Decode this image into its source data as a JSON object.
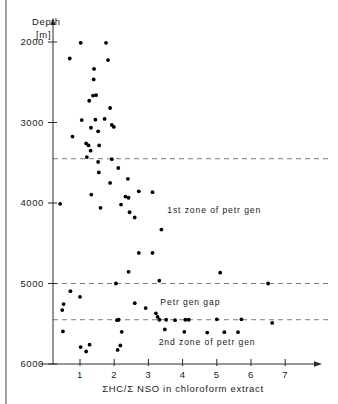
{
  "axes": {
    "y_title_line1": "Depth",
    "y_title_line2": "[m]",
    "x_title": "ΣHC/Σ NSO in chloroform extract",
    "y_ticks": [
      {
        "label": "2000",
        "value": 2000
      },
      {
        "label": "3000",
        "value": 3000
      },
      {
        "label": "4000",
        "value": 4000
      },
      {
        "label": "5000",
        "value": 5000
      },
      {
        "label": "6000",
        "value": 6000
      }
    ],
    "x_ticks": [
      {
        "label": "1",
        "value": 1
      },
      {
        "label": "2",
        "value": 2
      },
      {
        "label": "3",
        "value": 3
      },
      {
        "label": "4",
        "value": 4
      },
      {
        "label": "5",
        "value": 5
      },
      {
        "label": "6",
        "value": 6
      },
      {
        "label": "7",
        "value": 7
      }
    ]
  },
  "annotations": [
    {
      "name": "first-zone-label",
      "text": "1st zone of petr gen",
      "x": 3.55,
      "y": 4130
    },
    {
      "name": "petr-gen-gap-label",
      "text": "Petr gen gap",
      "x": 3.35,
      "y": 5270
    },
    {
      "name": "second-zone-label",
      "text": "2nd zone of petr gen",
      "x": 3.3,
      "y": 5760
    }
  ],
  "reference_lines": [
    {
      "name": "top-of-first-zone",
      "depth": 3450
    },
    {
      "name": "base-of-first-zone",
      "depth": 5000
    },
    {
      "name": "top-of-second-zone",
      "depth": 5450
    }
  ],
  "colors": {
    "point": "#000000",
    "axis": "#2a2a2a",
    "dashed": "#7d7d7d",
    "background": "#ffffff"
  },
  "chart_data": {
    "type": "scatter",
    "title": "",
    "xlabel": "ΣHC/Σ NSO in chloroform extract",
    "ylabel": "Depth [m]",
    "xlim": [
      0.3,
      7.8
    ],
    "ylim": [
      6100,
      1780
    ],
    "y_inverted": true,
    "grid": false,
    "legend": false,
    "marker": "filled-circle",
    "points": [
      {
        "x": 1.02,
        "y": 2010
      },
      {
        "x": 1.76,
        "y": 2010
      },
      {
        "x": 0.7,
        "y": 2205
      },
      {
        "x": 1.82,
        "y": 2225
      },
      {
        "x": 1.41,
        "y": 2335
      },
      {
        "x": 1.4,
        "y": 2465
      },
      {
        "x": 1.38,
        "y": 2665
      },
      {
        "x": 1.47,
        "y": 2660
      },
      {
        "x": 1.27,
        "y": 2730
      },
      {
        "x": 1.88,
        "y": 2820
      },
      {
        "x": 1.05,
        "y": 2970
      },
      {
        "x": 1.45,
        "y": 2965
      },
      {
        "x": 1.72,
        "y": 2955
      },
      {
        "x": 1.32,
        "y": 3065
      },
      {
        "x": 1.93,
        "y": 3030
      },
      {
        "x": 1.99,
        "y": 3055
      },
      {
        "x": 0.78,
        "y": 3175
      },
      {
        "x": 1.53,
        "y": 3110
      },
      {
        "x": 1.18,
        "y": 3260
      },
      {
        "x": 1.25,
        "y": 3285
      },
      {
        "x": 1.56,
        "y": 3285
      },
      {
        "x": 1.31,
        "y": 3350
      },
      {
        "x": 1.2,
        "y": 3430
      },
      {
        "x": 1.53,
        "y": 3490
      },
      {
        "x": 1.93,
        "y": 3455
      },
      {
        "x": 1.55,
        "y": 3620
      },
      {
        "x": 2.12,
        "y": 3565
      },
      {
        "x": 1.88,
        "y": 3750
      },
      {
        "x": 2.4,
        "y": 3700
      },
      {
        "x": 0.42,
        "y": 4010
      },
      {
        "x": 1.33,
        "y": 3895
      },
      {
        "x": 2.72,
        "y": 3855
      },
      {
        "x": 2.33,
        "y": 3920
      },
      {
        "x": 2.42,
        "y": 3935
      },
      {
        "x": 3.12,
        "y": 3865
      },
      {
        "x": 1.6,
        "y": 4060
      },
      {
        "x": 2.2,
        "y": 4020
      },
      {
        "x": 2.45,
        "y": 4115
      },
      {
        "x": 2.6,
        "y": 4180
      },
      {
        "x": 3.38,
        "y": 4330
      },
      {
        "x": 2.72,
        "y": 4620
      },
      {
        "x": 3.12,
        "y": 4620
      },
      {
        "x": 2.42,
        "y": 4855
      },
      {
        "x": 5.1,
        "y": 4865
      },
      {
        "x": 2.05,
        "y": 5000
      },
      {
        "x": 3.32,
        "y": 4965
      },
      {
        "x": 6.5,
        "y": 5000
      },
      {
        "x": 0.72,
        "y": 5095
      },
      {
        "x": 1.0,
        "y": 5165
      },
      {
        "x": 0.52,
        "y": 5255
      },
      {
        "x": 2.6,
        "y": 5245
      },
      {
        "x": 0.48,
        "y": 5330
      },
      {
        "x": 2.92,
        "y": 5305
      },
      {
        "x": 3.22,
        "y": 5370
      },
      {
        "x": 3.27,
        "y": 5415
      },
      {
        "x": 2.08,
        "y": 5455
      },
      {
        "x": 2.13,
        "y": 5450
      },
      {
        "x": 3.32,
        "y": 5450
      },
      {
        "x": 3.52,
        "y": 5450
      },
      {
        "x": 3.78,
        "y": 5455
      },
      {
        "x": 4.08,
        "y": 5450
      },
      {
        "x": 4.18,
        "y": 5450
      },
      {
        "x": 5.0,
        "y": 5445
      },
      {
        "x": 5.72,
        "y": 5445
      },
      {
        "x": 6.62,
        "y": 5490
      },
      {
        "x": 0.5,
        "y": 5595
      },
      {
        "x": 2.22,
        "y": 5600
      },
      {
        "x": 3.48,
        "y": 5570
      },
      {
        "x": 4.05,
        "y": 5600
      },
      {
        "x": 4.72,
        "y": 5610
      },
      {
        "x": 5.22,
        "y": 5605
      },
      {
        "x": 5.62,
        "y": 5605
      },
      {
        "x": 1.02,
        "y": 5790
      },
      {
        "x": 1.28,
        "y": 5760
      },
      {
        "x": 2.18,
        "y": 5770
      },
      {
        "x": 1.18,
        "y": 5845
      },
      {
        "x": 2.1,
        "y": 5825
      }
    ]
  }
}
